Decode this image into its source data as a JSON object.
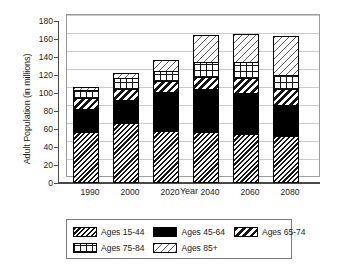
{
  "chart_data": {
    "type": "bar",
    "stacked": true,
    "title": "",
    "xlabel": "Year",
    "ylabel": "Adult Population (in millions)",
    "categories": [
      "1990",
      "2000",
      "2020",
      "2040",
      "2060",
      "2080"
    ],
    "ylim": [
      0,
      180
    ],
    "yticks": [
      0,
      20,
      40,
      60,
      80,
      100,
      120,
      140,
      160,
      180
    ],
    "grid": true,
    "legend_position": "bottom",
    "series": [
      {
        "name": "Ages 15-44",
        "pattern": "dense-diagonal-hatch",
        "values": [
          57,
          67,
          58,
          57,
          54,
          52
        ]
      },
      {
        "name": "Ages 45-64",
        "pattern": "solid-black",
        "values": [
          25,
          25,
          43,
          48,
          46,
          35
        ]
      },
      {
        "name": "Ages 65-74",
        "pattern": "bold-diagonal-stripe",
        "values": [
          12,
          13,
          12,
          13,
          17,
          18
        ]
      },
      {
        "name": "Ages 75-84",
        "pattern": "grid-crosshatch",
        "values": [
          9,
          12,
          12,
          16,
          17,
          15
        ]
      },
      {
        "name": "Ages 85+",
        "pattern": "light-diagonal-hatch",
        "values": [
          4,
          5,
          12,
          31,
          32,
          43
        ]
      }
    ],
    "totals": [
      107,
      122,
      137,
      165,
      166,
      163
    ]
  },
  "legend": {
    "entries": [
      {
        "label": "Ages 15-44"
      },
      {
        "label": "Ages 45-64"
      },
      {
        "label": "Ages 65-74"
      },
      {
        "label": "Ages 75-84"
      },
      {
        "label": "Ages 85+"
      }
    ]
  }
}
